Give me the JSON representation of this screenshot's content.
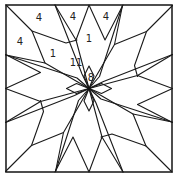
{
  "diagram": {
    "stroke_color": "#1a1a1a",
    "background": "#ffffff",
    "border": {
      "x": 6,
      "y": 5,
      "width": 166,
      "height": 167
    },
    "center": {
      "x": 89,
      "y": 88.5
    },
    "labels": [
      {
        "id": "label-a",
        "text": "4",
        "x": 39,
        "y": 17
      },
      {
        "id": "label-b",
        "text": "4",
        "x": 73,
        "y": 16
      },
      {
        "id": "label-c",
        "text": "4",
        "x": 106,
        "y": 16
      },
      {
        "id": "label-d",
        "text": "4",
        "x": 20,
        "y": 41
      },
      {
        "id": "label-e",
        "text": "1",
        "x": 53,
        "y": 53
      },
      {
        "id": "label-f",
        "text": "1",
        "x": 89,
        "y": 38
      },
      {
        "id": "label-g",
        "text": "11",
        "x": 76,
        "y": 62
      },
      {
        "id": "label-h",
        "text": "8",
        "x": 91,
        "y": 77
      }
    ]
  }
}
